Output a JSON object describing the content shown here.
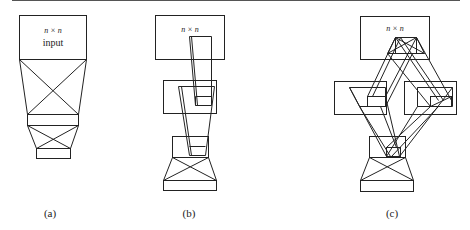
{
  "figure": {
    "panels": [
      {
        "id": "a",
        "caption": "(a)",
        "top_box": {
          "dim_label": "n × n",
          "sub_label": "input"
        }
      },
      {
        "id": "b",
        "caption": "(b)",
        "top_box": {
          "dim_label": "n × n"
        }
      },
      {
        "id": "c",
        "caption": "(c)",
        "top_box": {
          "dim_label": "n × n"
        }
      }
    ]
  }
}
